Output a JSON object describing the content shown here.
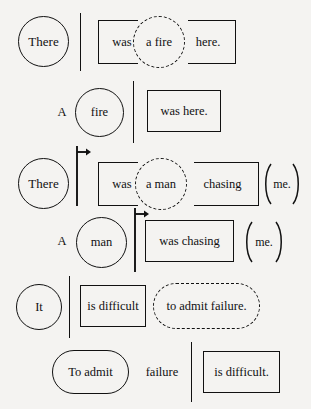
{
  "figure": {
    "background_color": "#f4f3f1",
    "ink_color": "#111111",
    "rows": [
      {
        "id": "row-1",
        "tokens": [
          {
            "text": "There",
            "shape": "circle"
          },
          {
            "text": "was",
            "shape": "bracket-left"
          },
          {
            "text": "a fire",
            "shape": "circle-dashed"
          },
          {
            "text": "here.",
            "shape": "bracket-right"
          }
        ],
        "dividers": [
          {
            "type": "bar"
          }
        ]
      },
      {
        "id": "row-2",
        "tokens": [
          {
            "text": "A",
            "shape": "plain"
          },
          {
            "text": "fire",
            "shape": "circle"
          },
          {
            "text": "was here.",
            "shape": "rect"
          }
        ],
        "dividers": [
          {
            "type": "bar"
          }
        ]
      },
      {
        "id": "row-3",
        "tokens": [
          {
            "text": "There",
            "shape": "circle"
          },
          {
            "text": "was",
            "shape": "bracket-left"
          },
          {
            "text": "a man",
            "shape": "circle-dashed"
          },
          {
            "text": "chasing",
            "shape": "bracket-right"
          },
          {
            "text": "me.",
            "shape": "paren"
          }
        ],
        "dividers": [
          {
            "type": "bar-arrow"
          }
        ]
      },
      {
        "id": "row-4",
        "tokens": [
          {
            "text": "A",
            "shape": "plain"
          },
          {
            "text": "man",
            "shape": "circle"
          },
          {
            "text": "was chasing",
            "shape": "rect"
          },
          {
            "text": "me.",
            "shape": "paren"
          }
        ],
        "dividers": [
          {
            "type": "bar-arrow"
          }
        ]
      },
      {
        "id": "row-5",
        "tokens": [
          {
            "text": "It",
            "shape": "circle"
          },
          {
            "text": "is difficult",
            "shape": "rect"
          },
          {
            "text": "to admit failure.",
            "shape": "stadium-dashed"
          }
        ],
        "dividers": [
          {
            "type": "bar"
          }
        ]
      },
      {
        "id": "row-6",
        "tokens": [
          {
            "text": "To admit",
            "shape": "stadium"
          },
          {
            "text": "failure",
            "shape": "plain"
          },
          {
            "text": "is difficult.",
            "shape": "rect"
          }
        ],
        "dividers": [
          {
            "type": "bar"
          }
        ]
      }
    ]
  }
}
